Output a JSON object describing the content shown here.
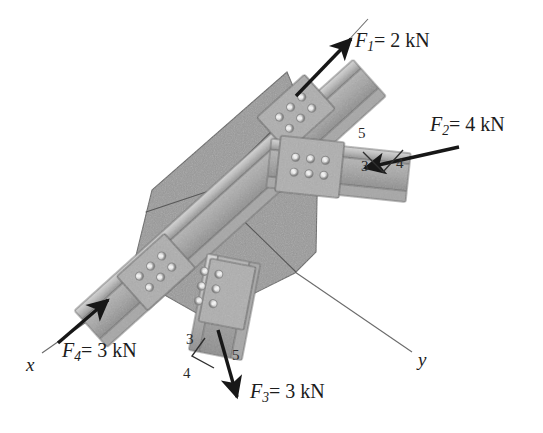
{
  "figure": {
    "kind": "engineering-free-body-diagram",
    "background_color": "#ffffff",
    "ink_color": "#1c1c1c",
    "plate_color": "#9a9a9a",
    "member_color": "#b0b0b0",
    "seam_color": "#5a5a5a"
  },
  "axes": [
    {
      "id": "x",
      "label": "x",
      "label_x": 28,
      "label_y": 360
    },
    {
      "id": "y",
      "label": "y",
      "label_x": 420,
      "label_y": 355
    }
  ],
  "forces": [
    {
      "id": "F1",
      "symbol": "F",
      "subscript": "1",
      "equals": "=",
      "magnitude": "2",
      "unit": "kN",
      "text": "F1 = 2 kN",
      "direction": "up-right along diagonal member",
      "label_x": 355,
      "label_y": 30,
      "slope_triangle": null
    },
    {
      "id": "F2",
      "symbol": "F",
      "subscript": "2",
      "equals": "=",
      "magnitude": "4",
      "unit": "kN",
      "text": "F2 = 4 kN",
      "direction": "leftward, slightly downward toward plate",
      "label_x": 430,
      "label_y": 114,
      "slope_triangle": {
        "horizontal": "4",
        "vertical": "3",
        "hypotenuse": "5"
      }
    },
    {
      "id": "F3",
      "symbol": "F",
      "subscript": "3",
      "equals": "=",
      "magnitude": "3",
      "unit": "kN",
      "text": "F3 = 3 kN",
      "direction": "downward away from plate",
      "label_x": 250,
      "label_y": 381,
      "slope_triangle": {
        "horizontal": "4",
        "vertical": "3",
        "hypotenuse": "5"
      }
    },
    {
      "id": "F4",
      "symbol": "F",
      "subscript": "4",
      "equals": "=",
      "magnitude": "3",
      "unit": "kN",
      "text": "F4 = 3 kN",
      "direction": "up-right into plate along diagonal member",
      "label_x": 62,
      "label_y": 340,
      "slope_triangle": null
    }
  ],
  "slope_annotations": [
    {
      "for": "F2",
      "values": [
        {
          "n": "5",
          "x": 358,
          "y": 134
        },
        {
          "n": "3",
          "x": 365,
          "y": 166
        },
        {
          "n": "4",
          "x": 398,
          "y": 163
        }
      ]
    },
    {
      "for": "F3",
      "values": [
        {
          "n": "3",
          "x": 186,
          "y": 340
        },
        {
          "n": "5",
          "x": 233,
          "y": 354
        },
        {
          "n": "4",
          "x": 186,
          "y": 372
        }
      ]
    }
  ],
  "members": [
    {
      "id": "member-diagonal",
      "carries": [
        "F1",
        "F4"
      ],
      "bolt_rows": 2,
      "bolt_cols": 3,
      "bolt_count": 6
    },
    {
      "id": "member-right",
      "carries": [
        "F2"
      ],
      "bolt_rows": 2,
      "bolt_cols": 3,
      "bolt_count": 6
    },
    {
      "id": "member-bottom",
      "carries": [
        "F3"
      ],
      "bolt_rows": 2,
      "bolt_cols": 3,
      "bolt_count": 6
    }
  ],
  "gusset_plate": {
    "id": "gusset-plate",
    "shape": "irregular heptagon",
    "seam_origin_x": 212,
    "seam_origin_y": 190
  }
}
